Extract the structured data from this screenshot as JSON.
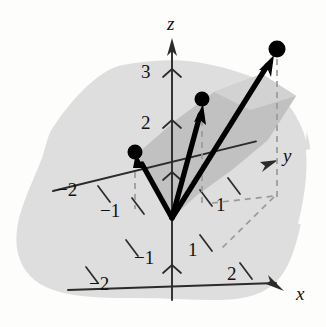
{
  "figure": {
    "background_color": "#fdfdfc",
    "blob_color": "#dedede",
    "wedge_color": "#c4c4c4",
    "axis_color": "#2b2b2b",
    "vector_color": "#000000",
    "dash_color": "#9a9a9a",
    "dot_color": "#000000"
  },
  "axes": [
    {
      "name": "z",
      "label": "z",
      "direction": "up"
    },
    {
      "name": "y",
      "label": "y",
      "direction": "up-right"
    },
    {
      "name": "x",
      "label": "x",
      "direction": "down-right"
    }
  ],
  "tick_labels": {
    "z": [
      "3",
      "2"
    ],
    "y_positive": [
      "1"
    ],
    "y_negative": [
      "-1",
      "-2"
    ],
    "x_positive": [
      "1",
      "2"
    ],
    "x_negative": [
      "-1",
      "-2"
    ]
  },
  "labels": [
    {
      "name": "axis-label-z",
      "text": "z",
      "x": 167,
      "y": 14,
      "kind": "axis"
    },
    {
      "name": "axis-label-y",
      "text": "y",
      "x": 283,
      "y": 146,
      "kind": "axis"
    },
    {
      "name": "axis-label-x",
      "text": "x",
      "x": 296,
      "y": 284,
      "kind": "axis"
    },
    {
      "name": "tick-label-z-3",
      "text": "3",
      "x": 141,
      "y": 62,
      "kind": "tick"
    },
    {
      "name": "tick-label-z-2",
      "text": "2",
      "x": 141,
      "y": 113,
      "kind": "tick"
    },
    {
      "name": "tick-label-y-neg2",
      "text": "−2",
      "x": 57,
      "y": 180,
      "kind": "tick"
    },
    {
      "name": "tick-label-y-neg1",
      "text": "−1",
      "x": 100,
      "y": 201,
      "kind": "tick"
    },
    {
      "name": "tick-label-y-pos1",
      "text": "1",
      "x": 216,
      "y": 195,
      "kind": "tick"
    },
    {
      "name": "tick-label-x-neg1",
      "text": "−1",
      "x": 134,
      "y": 248,
      "kind": "tick"
    },
    {
      "name": "tick-label-x-neg2",
      "text": "−2",
      "x": 89,
      "y": 274,
      "kind": "tick"
    },
    {
      "name": "tick-label-x-pos1",
      "text": "1",
      "x": 188,
      "y": 240,
      "kind": "tick"
    },
    {
      "name": "tick-label-x-pos2",
      "text": "2",
      "x": 227,
      "y": 264,
      "kind": "tick"
    }
  ],
  "chart_data": {
    "type": "scatter",
    "xlabel": "x",
    "ylabel": "y",
    "zlabel": "z",
    "origin_px": [
      172,
      218
    ],
    "axis_ranges": {
      "x": [
        -2,
        2
      ],
      "y": [
        -2,
        2
      ],
      "z": [
        -1,
        3
      ]
    },
    "grid": false,
    "legend": "none",
    "points_px": [
      {
        "name": "point-left",
        "x": 135,
        "y": 152,
        "radius": 7
      },
      {
        "name": "point-mid",
        "x": 202,
        "y": 99,
        "radius": 7
      },
      {
        "name": "point-right",
        "x": 277,
        "y": 49,
        "radius": 8
      }
    ],
    "vectors_px": [
      {
        "name": "vector-left",
        "from": [
          172,
          218
        ],
        "to": [
          139,
          158
        ]
      },
      {
        "name": "vector-mid",
        "from": [
          172,
          218
        ],
        "to": [
          201,
          108
        ]
      },
      {
        "name": "vector-right",
        "from": [
          172,
          218
        ],
        "to": [
          272,
          58
        ]
      }
    ],
    "dashed_drops_px": [
      {
        "name": "drop-left",
        "from": [
          135,
          160
        ],
        "to": [
          135,
          208
        ]
      },
      {
        "name": "drop-mid",
        "from": [
          202,
          108
        ],
        "to": [
          202,
          203
        ]
      },
      {
        "name": "drop-right",
        "from": [
          277,
          58
        ],
        "to": [
          277,
          197
        ]
      }
    ],
    "dashed_projection_px": [
      {
        "name": "proj-y-to-corner",
        "from": [
          213,
          205
        ],
        "to": [
          272,
          197
        ]
      },
      {
        "name": "proj-corner-to-x",
        "from": [
          272,
          197
        ],
        "to": [
          218,
          250
        ]
      }
    ]
  }
}
